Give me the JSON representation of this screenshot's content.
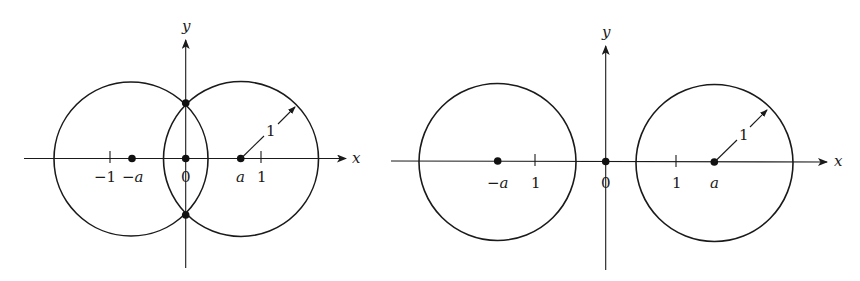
{
  "figures": [
    {
      "id": "overlapping",
      "axis_labels": {
        "x": "x",
        "y": "y"
      },
      "tick_labels": {
        "neg_one": "−1",
        "neg_a": "−a",
        "zero": "0",
        "a": "a",
        "one": "1"
      },
      "radius_label": "1",
      "description": "Two unit circles centered at −a and a with a < 1, overlapping and intersecting on the y-axis"
    },
    {
      "id": "separated",
      "axis_labels": {
        "x": "x",
        "y": "y"
      },
      "tick_labels": {
        "neg_a": "−a",
        "one_left": "1",
        "zero": "0",
        "one_right": "1",
        "a": "a"
      },
      "radius_label": "1",
      "description": "Two unit circles centered at −a and a with a > 1, disjoint"
    }
  ],
  "colors": {
    "ink": "#1a1a1a",
    "background": "#ffffff"
  }
}
